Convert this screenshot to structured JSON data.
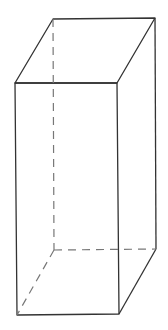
{
  "diagram": {
    "type": "rectangular-prism",
    "stroke_color": "#333333",
    "hidden_stroke_color": "#777777",
    "vertices": {
      "top_back_left": [
        53,
        19
      ],
      "top_back_right": [
        155,
        18
      ],
      "top_front_left": [
        15,
        83
      ],
      "top_front_right": [
        117,
        83
      ],
      "bottom_back_left": [
        54,
        250
      ],
      "bottom_back_right": [
        156,
        249
      ],
      "bottom_front_left": [
        17,
        315
      ],
      "bottom_front_right": [
        119,
        314
      ]
    }
  }
}
